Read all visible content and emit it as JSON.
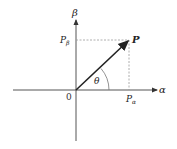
{
  "diagram": {
    "labels": {
      "beta_axis": "β",
      "alpha_axis": "α",
      "origin": "0",
      "point": "P",
      "p_beta": "P",
      "p_beta_sub": "β",
      "p_alpha": "P",
      "p_alpha_sub": "α",
      "angle": "θ"
    },
    "colors": {
      "axis": "#555555",
      "vector": "#222222",
      "dashed": "#999999"
    }
  }
}
